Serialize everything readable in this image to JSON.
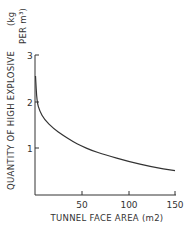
{
  "chart_data": {
    "type": "line",
    "title": "",
    "xlabel": "TUNNEL FACE AREA (m2)",
    "ylabel_line1": "QUANTITY OF HIGH EXPLOSIVE",
    "ylabel_unit_a": "(kg",
    "ylabel_unit_b": "PER m³)",
    "xlim": [
      0,
      150
    ],
    "ylim": [
      0,
      3
    ],
    "x_ticks": [
      "50",
      "100",
      "150"
    ],
    "y_ticks": [
      "1",
      "2",
      "3"
    ],
    "grid": false,
    "legend": null,
    "series": [
      {
        "name": "High explosive quantity",
        "x": [
          0.5,
          2,
          5,
          10,
          20,
          30,
          40,
          50,
          60,
          75,
          100,
          125,
          150
        ],
        "y": [
          2.55,
          2.0,
          1.8,
          1.62,
          1.42,
          1.28,
          1.15,
          1.05,
          0.96,
          0.86,
          0.72,
          0.6,
          0.52
        ]
      }
    ]
  }
}
